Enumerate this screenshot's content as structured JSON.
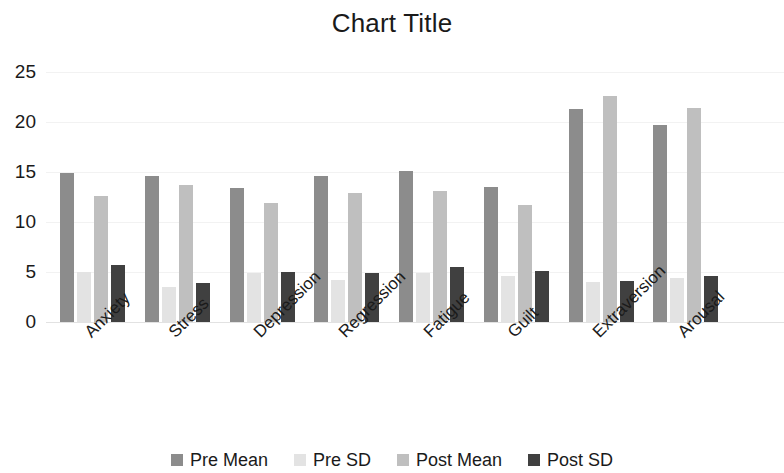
{
  "chart_data": {
    "type": "bar",
    "title": "Chart Title",
    "xlabel": "",
    "ylabel": "",
    "ylim": [
      0,
      25
    ],
    "yticks": [
      0,
      5,
      10,
      15,
      20,
      25
    ],
    "grid": true,
    "legend_position": "bottom",
    "categories": [
      "Anxiety",
      "Stress",
      "Depression",
      "Regression",
      "Fatigue",
      "Guilt",
      "Extraversion",
      "Arousal"
    ],
    "series": [
      {
        "name": "Pre Mean",
        "color": "#8c8c8c",
        "values": [
          14.9,
          14.6,
          13.4,
          14.6,
          15.1,
          13.5,
          21.3,
          19.7
        ]
      },
      {
        "name": "Pre SD",
        "color": "#e3e3e3",
        "values": [
          5.0,
          3.5,
          4.9,
          4.2,
          4.9,
          4.6,
          4.0,
          4.4
        ]
      },
      {
        "name": "Post Mean",
        "color": "#bfbfbf",
        "values": [
          12.6,
          13.7,
          11.9,
          12.9,
          13.1,
          11.7,
          22.6,
          21.4
        ]
      },
      {
        "name": "Post SD",
        "color": "#404040",
        "values": [
          5.7,
          3.9,
          5.0,
          4.9,
          5.5,
          5.1,
          4.1,
          4.6
        ]
      }
    ]
  },
  "legend": {
    "items": [
      {
        "label": "Pre Mean",
        "color": "#8c8c8c"
      },
      {
        "label": "Pre SD",
        "color": "#e3e3e3"
      },
      {
        "label": "Post Mean",
        "color": "#bfbfbf"
      },
      {
        "label": "Post SD",
        "color": "#404040"
      }
    ]
  }
}
